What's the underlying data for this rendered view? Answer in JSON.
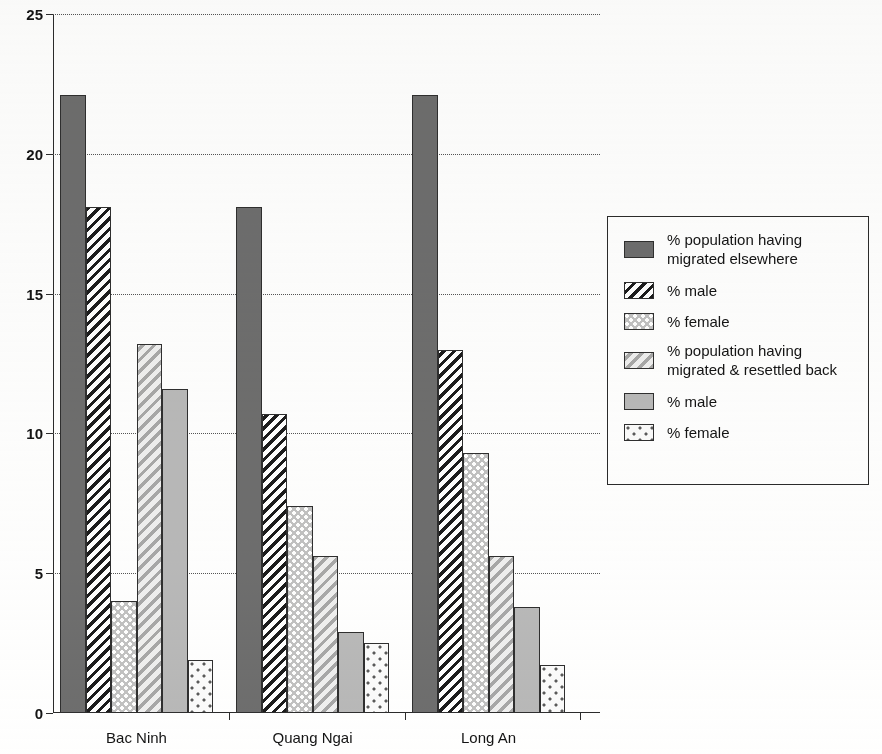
{
  "chart_data": {
    "type": "bar",
    "title": "",
    "subtitle": "",
    "xlabel": "",
    "ylabel": "",
    "categories": [
      "Bac Ninh",
      "Quang Ngai",
      "Long An"
    ],
    "ylim": [
      0,
      25
    ],
    "yticks": [
      0,
      5,
      10,
      15,
      20,
      25
    ],
    "ytick_labels": [
      "0",
      "5",
      "10",
      "15",
      "20",
      "25"
    ],
    "grid": true,
    "grid_style": "dotted-horizontal",
    "legend_position": "right",
    "series": [
      {
        "name": "% population having\nmigrated elsewhere",
        "pattern": "solid-dark-gray",
        "color": "#6e6e6e",
        "values": [
          22.1,
          18.1,
          22.1
        ]
      },
      {
        "name": "% male",
        "pattern": "diagonal-stripes-black",
        "color": "#1c1c1c",
        "values": [
          18.1,
          10.7,
          13.0
        ]
      },
      {
        "name": "% female",
        "pattern": "dense-dots-on-gray",
        "color": "#c2c2c2",
        "values": [
          4.0,
          7.4,
          9.3
        ]
      },
      {
        "name": "% population having\nmigrated & resettled back",
        "pattern": "diagonal-stripes-light",
        "color": "#e9e9e9",
        "values": [
          13.2,
          5.6,
          5.6
        ]
      },
      {
        "name": "% male",
        "pattern": "solid-light-gray",
        "color": "#b9b9b9",
        "values": [
          11.6,
          2.9,
          3.8
        ]
      },
      {
        "name": "% female",
        "pattern": "sparse-dots-on-white",
        "color": "#fbfbfb",
        "values": [
          1.9,
          2.5,
          1.7
        ]
      }
    ]
  },
  "legend": {
    "items": [
      {
        "label": "% population having\nmigrated elsewhere",
        "swatch": "solid-dark-gray"
      },
      {
        "label": "% male",
        "swatch": "diagonal-stripes-black"
      },
      {
        "label": "% female",
        "swatch": "dense-dots-on-gray"
      },
      {
        "label": "% population having\nmigrated & resettled back",
        "swatch": "diagonal-stripes-light"
      },
      {
        "label": "% male",
        "swatch": "solid-light-gray"
      },
      {
        "label": "% female",
        "swatch": "sparse-dots-on-white"
      }
    ]
  }
}
